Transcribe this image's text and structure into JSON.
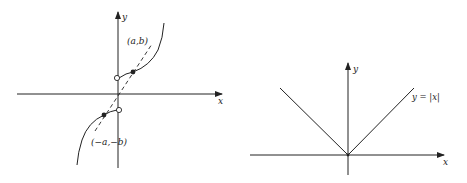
{
  "figures": [
    {
      "id": "odd-function-graph",
      "axes": {
        "x_label": "x",
        "y_label": "y"
      },
      "points": [
        {
          "label": "(a,b)",
          "type": "solid"
        },
        {
          "label": "(−a,−b)",
          "type": "solid"
        }
      ],
      "open_circles": 2,
      "dashed_line": "through origin connecting (a,b) and (−a,−b)"
    },
    {
      "id": "absolute-value-graph",
      "axes": {
        "x_label": "x",
        "y_label": "y"
      },
      "curve_label": "y = |x|"
    }
  ],
  "colors": {
    "ink": "#222222",
    "background": "#ffffff"
  }
}
